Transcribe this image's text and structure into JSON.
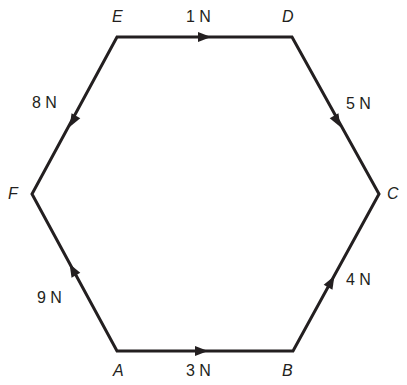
{
  "diagram": {
    "type": "force hexagon",
    "colors": {
      "line": "#231f20",
      "background": "#ffffff"
    },
    "vertices": [
      {
        "id": "A",
        "label": "A",
        "x": 117,
        "y": 351
      },
      {
        "id": "B",
        "label": "B",
        "x": 293,
        "y": 351
      },
      {
        "id": "C",
        "label": "C",
        "x": 379,
        "y": 194
      },
      {
        "id": "D",
        "label": "D",
        "x": 292,
        "y": 37
      },
      {
        "id": "E",
        "label": "E",
        "x": 117,
        "y": 37
      },
      {
        "id": "F",
        "label": "F",
        "x": 32,
        "y": 194
      }
    ],
    "forces": [
      {
        "from": "A",
        "to": "B",
        "magnitude": "3 N"
      },
      {
        "from": "B",
        "to": "C",
        "magnitude": "4 N"
      },
      {
        "from": "D",
        "to": "C",
        "magnitude": "5 N"
      },
      {
        "from": "E",
        "to": "D",
        "magnitude": "1 N"
      },
      {
        "from": "E",
        "to": "F",
        "magnitude": "8 N"
      },
      {
        "from": "A",
        "to": "F",
        "magnitude": "9 N"
      }
    ]
  }
}
